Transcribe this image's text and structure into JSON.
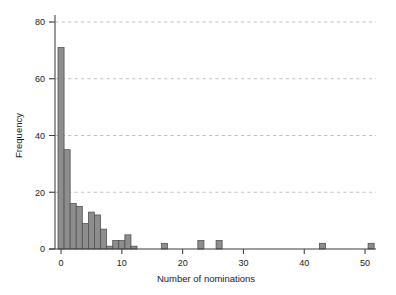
{
  "chart_data": {
    "type": "bar",
    "title": "",
    "subtitle": "",
    "xlabel": "Number of nominations",
    "ylabel": "Frequency",
    "xlim": [
      -1.2,
      53
    ],
    "ylim": [
      0,
      82
    ],
    "xticks": [
      0,
      10,
      20,
      30,
      40,
      50
    ],
    "xtick_labels": [
      "0",
      "10",
      "20",
      "30",
      "40",
      "50"
    ],
    "yticks": [
      0,
      20,
      40,
      60,
      80
    ],
    "ytick_labels": [
      "0",
      "20",
      "40",
      "60",
      "80"
    ],
    "grid": "horizontal-dashed",
    "legend": "none",
    "bar_fill": "#8d8d8d",
    "bar_edge": "#4d4d4d",
    "bin_width": 1,
    "categories": [
      0,
      1,
      2,
      3,
      4,
      5,
      6,
      7,
      8,
      9,
      10,
      11,
      12,
      17,
      23,
      26,
      43,
      51
    ],
    "values": [
      71,
      35,
      16,
      15,
      9,
      13,
      12,
      7,
      1,
      3,
      3,
      5,
      1,
      2,
      3,
      3,
      2,
      2
    ],
    "bars": [
      {
        "x": 0,
        "frequency": 71
      },
      {
        "x": 1,
        "frequency": 35
      },
      {
        "x": 2,
        "frequency": 16
      },
      {
        "x": 3,
        "frequency": 15
      },
      {
        "x": 4,
        "frequency": 9
      },
      {
        "x": 5,
        "frequency": 13
      },
      {
        "x": 6,
        "frequency": 12
      },
      {
        "x": 7,
        "frequency": 7
      },
      {
        "x": 8,
        "frequency": 1
      },
      {
        "x": 9,
        "frequency": 3
      },
      {
        "x": 10,
        "frequency": 3
      },
      {
        "x": 11,
        "frequency": 5
      },
      {
        "x": 12,
        "frequency": 1
      },
      {
        "x": 17,
        "frequency": 2
      },
      {
        "x": 23,
        "frequency": 3
      },
      {
        "x": 26,
        "frequency": 3
      },
      {
        "x": 43,
        "frequency": 2
      },
      {
        "x": 51,
        "frequency": 2
      }
    ]
  }
}
